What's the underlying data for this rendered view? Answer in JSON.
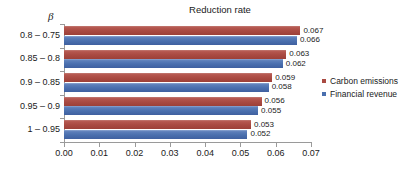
{
  "chart_data": {
    "type": "bar",
    "orientation": "horizontal",
    "title": "Reduction rate",
    "xlabel": "",
    "ylabel": "β",
    "categories": [
      "0.8 – 0.75",
      "0.85 – 0.8",
      "0.9 – 0.85",
      "0.95 – 0.9",
      "1 – 0.95"
    ],
    "series": [
      {
        "name": "Carbon emissions",
        "color": "#a94a42",
        "values": [
          0.067,
          0.063,
          0.059,
          0.056,
          0.053
        ],
        "labels": [
          "0.067",
          "0.063",
          "0.059",
          "0.056",
          "0.053"
        ]
      },
      {
        "name": "Financial revenue",
        "color": "#4a6fae",
        "values": [
          0.066,
          0.062,
          0.058,
          0.055,
          0.052
        ],
        "labels": [
          "0.066",
          "0.062",
          "0.058",
          "0.055",
          "0.052"
        ]
      }
    ],
    "xlim": [
      0.0,
      0.07
    ],
    "xticks": [
      0.0,
      0.01,
      0.02,
      0.03,
      0.04,
      0.05,
      0.06,
      0.07
    ],
    "xtick_labels": [
      "0.00",
      "0.01",
      "0.02",
      "0.03",
      "0.04",
      "0.05",
      "0.06",
      "0.07"
    ],
    "grid": false,
    "legend_position": "right",
    "background_color": "#ffffff",
    "axis_color": "#9a9a9a"
  },
  "legend": {
    "entries": [
      {
        "label": "Carbon emissions"
      },
      {
        "label": "Financial revenue"
      }
    ]
  }
}
